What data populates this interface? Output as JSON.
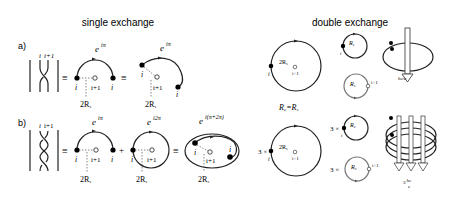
{
  "titles": {
    "single": "single exchange",
    "double": "double exchange"
  },
  "panels": {
    "a": {
      "label": "a)",
      "braid_top_left": "i",
      "braid_top_right": "i+1",
      "equiv": "≡",
      "d1": {
        "phase": "e",
        "phase_exp": "iπ",
        "left": "i",
        "center": "i+1",
        "right": "i",
        "radius": "2R",
        "radius_sub": "s"
      },
      "d2": {
        "phase": "e",
        "phase_exp": "iπ",
        "left": "i",
        "center": "i+1",
        "end": "i",
        "radius": "2R",
        "radius_sub": "s"
      }
    },
    "b": {
      "label": "b)",
      "braid_top_left": "i",
      "braid_top_right": "i+1",
      "equiv": "≡",
      "plus": "+",
      "d1": {
        "phase": "e",
        "phase_exp": "iπ",
        "left": "i",
        "center": "i+1",
        "right": "i",
        "radius": "2R",
        "radius_sub": "s"
      },
      "d2": {
        "phase": "e",
        "phase_exp": "i2π",
        "left": "i",
        "center": "i+1",
        "radius": "2R",
        "radius_sub": "s"
      },
      "d3": {
        "phase": "e",
        "phase_exp": "i(π+2π)",
        "left": "i",
        "center": "i+1",
        "end": "i",
        "radius": "2R",
        "radius_sub": "s"
      }
    }
  },
  "double": {
    "top": {
      "big_radius": "2R",
      "big_radius_sub": "s",
      "big_left": "i",
      "big_center": "i+1",
      "small1_radius": "R",
      "small1_sub": "s",
      "small1_left": "i",
      "small2_radius": "R",
      "small2_sub": "s",
      "small2_right": "i+1",
      "flux": "hc/e"
    },
    "equation": "Rc=Rs",
    "eq_left": "R",
    "eq_left_sub": "c",
    "eq_right": "R",
    "eq_right_sub": "s",
    "bottom": {
      "prefix": "3 ×",
      "big_radius": "2R",
      "big_radius_sub": "s",
      "big_left": "i",
      "big_center": "i+1",
      "small1_radius": "R",
      "small1_sub": "c",
      "small1_left": "i",
      "small2_radius": "R",
      "small2_sub": "c",
      "small2_right": "i+1",
      "flux": "3 hc/e",
      "flux_coef": "3",
      "flux_num": "hc",
      "flux_den": "e"
    }
  }
}
